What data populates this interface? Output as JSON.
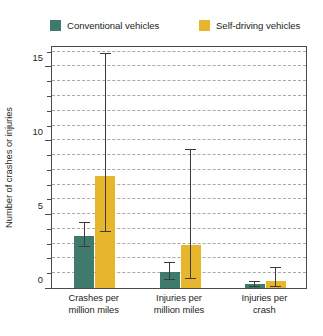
{
  "colors": {
    "conventional": "#3f7a6e",
    "selfdriving": "#e8b62c",
    "axis": "#4b4b4b",
    "grid": "#a9a9a9",
    "error": "#3b3b3b",
    "text": "#231f20"
  },
  "legend": {
    "position": "top",
    "entries": [
      {
        "label": "Conventional vehicles",
        "swatch": "#3f7a6e",
        "icon": "legend-swatch-icon"
      },
      {
        "label": "Self-driving vehicles",
        "swatch": "#e8b62c",
        "icon": "legend-swatch-icon"
      }
    ]
  },
  "chart_data": {
    "type": "bar",
    "title": "",
    "subtitle": "",
    "xlabel": "",
    "ylabel": "Number of crashes or injuries",
    "categories": [
      "Crashes per million miles",
      "Injuries per million miles",
      "Injuries per crash"
    ],
    "category_lines": [
      [
        "Crashes per",
        "million miles"
      ],
      [
        "Injuries per",
        "million miles"
      ],
      [
        "Injuries per",
        "crash"
      ]
    ],
    "series": [
      {
        "name": "Conventional vehicles",
        "color": "#3f7a6e",
        "values": [
          3.5,
          1.1,
          0.25
        ],
        "error_low": [
          2.8,
          0.55,
          0.1
        ],
        "error_high": [
          4.5,
          1.75,
          0.45
        ]
      },
      {
        "name": "Self-driving vehicles",
        "color": "#e8b62c",
        "values": [
          7.6,
          2.9,
          0.5
        ],
        "error_low": [
          3.8,
          0.6,
          0.05
        ],
        "error_high": [
          15.9,
          9.4,
          1.4
        ]
      }
    ],
    "ylim": [
      0,
      16.45
    ],
    "yticks": [
      0,
      5,
      10,
      15
    ],
    "ytick_labels": [
      "0",
      "5",
      "10",
      "15"
    ],
    "yminor_step": 1,
    "grid": true,
    "grid_axis": "y",
    "grid_style": "dashed",
    "error_bars": true,
    "legend_position": "top"
  }
}
